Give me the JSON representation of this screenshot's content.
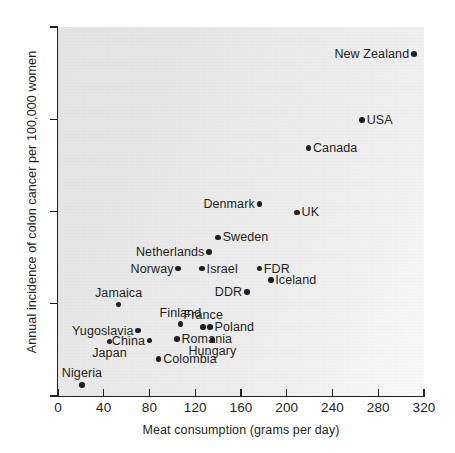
{
  "chart_data": {
    "type": "scatter",
    "title": "",
    "xlabel": "Meat consumption (grams per day)",
    "ylabel": "Annual incidence of colon cancer per 100,000 women",
    "xlim": [
      0,
      320
    ],
    "ylim": [
      10,
      50
    ],
    "xticks": [
      0,
      40,
      80,
      120,
      160,
      200,
      240,
      280,
      320
    ],
    "yticks": [
      10,
      20,
      30,
      40,
      50
    ],
    "xtick_labels": [
      "0",
      "40",
      "80",
      "120",
      "160",
      "200",
      "240",
      "280",
      "320"
    ],
    "ytick_labels": [
      "10",
      "20",
      "30",
      "40",
      "50"
    ],
    "grid": false,
    "legend": false,
    "marker_color": "#231f20",
    "plot_background": "#ececec",
    "points": [
      {
        "label": "New Zealand",
        "x": 311,
        "y": 47.1,
        "label_pos": "left"
      },
      {
        "label": "USA",
        "x": 266,
        "y": 39.9,
        "label_pos": "right"
      },
      {
        "label": "Canada",
        "x": 219,
        "y": 36.9,
        "label_pos": "right"
      },
      {
        "label": "Denmark",
        "x": 176,
        "y": 30.8,
        "label_pos": "left"
      },
      {
        "label": "UK",
        "x": 209,
        "y": 29.9,
        "label_pos": "right"
      },
      {
        "label": "Sweden",
        "x": 140,
        "y": 27.2,
        "label_pos": "right"
      },
      {
        "label": "Netherlands",
        "x": 132,
        "y": 25.6,
        "label_pos": "left"
      },
      {
        "label": "FDR",
        "x": 176,
        "y": 23.8,
        "label_pos": "right"
      },
      {
        "label": "Israel",
        "x": 126,
        "y": 23.8,
        "label_pos": "right"
      },
      {
        "label": "Norway",
        "x": 105,
        "y": 23.8,
        "label_pos": "left"
      },
      {
        "label": "Iceland",
        "x": 186,
        "y": 22.6,
        "label_pos": "right"
      },
      {
        "label": "DDR",
        "x": 165,
        "y": 21.3,
        "label_pos": "left"
      },
      {
        "label": "Jamaica",
        "x": 53,
        "y": 19.9,
        "label_pos": "above"
      },
      {
        "label": "Finland",
        "x": 107,
        "y": 17.8,
        "label_pos": "above"
      },
      {
        "label": "France",
        "x": 127,
        "y": 17.5,
        "label_pos": "above"
      },
      {
        "label": "Poland",
        "x": 133,
        "y": 17.5,
        "label_pos": "right"
      },
      {
        "label": "Yugoslavia",
        "x": 70,
        "y": 17.1,
        "label_pos": "left"
      },
      {
        "label": "Romania",
        "x": 104,
        "y": 16.2,
        "label_pos": "right"
      },
      {
        "label": "China",
        "x": 80,
        "y": 16.0,
        "label_pos": "left"
      },
      {
        "label": "Hungary",
        "x": 135,
        "y": 16.1,
        "label_pos": "below"
      },
      {
        "label": "Japan",
        "x": 45,
        "y": 15.9,
        "label_pos": "below"
      },
      {
        "label": "Colombia",
        "x": 88,
        "y": 14.0,
        "label_pos": "right"
      },
      {
        "label": "Nigeria",
        "x": 21,
        "y": 11.2,
        "label_pos": "above"
      }
    ]
  }
}
